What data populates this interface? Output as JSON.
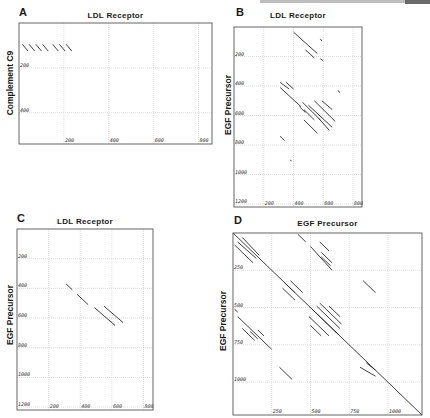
{
  "figure": {
    "panels": [
      {
        "id": "A",
        "letter": "A",
        "title": "LDL Receptor",
        "ylabel": "Complement C9"
      },
      {
        "id": "B",
        "letter": "B",
        "title": "LDL Receptor",
        "ylabel": "EGF Precursor"
      },
      {
        "id": "C",
        "letter": "C",
        "title": "LDL Receptor",
        "ylabel": "EGF Precursor"
      },
      {
        "id": "D",
        "letter": "D",
        "title": "EGF Precursor",
        "ylabel": "EGF Precursor"
      }
    ]
  },
  "chart_data": [
    {
      "type": "scatter",
      "subtype": "dot-matrix",
      "panel": "A",
      "title": "LDL Receptor",
      "xlabel": "LDL Receptor",
      "ylabel": "Complement C9",
      "xlim": [
        0,
        860
      ],
      "ylim": [
        540,
        0
      ],
      "x_ticks": [
        200,
        400,
        600,
        800
      ],
      "x_tick_labels": [
        "200",
        "400",
        "600",
        "800"
      ],
      "y_ticks": [
        200,
        400
      ],
      "y_tick_labels": [
        "200",
        "400"
      ],
      "grid": true,
      "segments": [
        [
          [
            15,
            95
          ],
          [
            40,
            125
          ]
        ],
        [
          [
            45,
            95
          ],
          [
            70,
            125
          ]
        ],
        [
          [
            75,
            95
          ],
          [
            100,
            125
          ]
        ],
        [
          [
            105,
            95
          ],
          [
            130,
            125
          ]
        ],
        [
          [
            150,
            95
          ],
          [
            175,
            125
          ]
        ],
        [
          [
            180,
            95
          ],
          [
            205,
            125
          ]
        ],
        [
          [
            210,
            95
          ],
          [
            235,
            125
          ]
        ]
      ]
    },
    {
      "type": "scatter",
      "subtype": "dot-matrix",
      "panel": "B",
      "title": "LDL Receptor",
      "xlabel": "LDL Receptor",
      "ylabel": "EGF Precursor",
      "xlim": [
        0,
        860
      ],
      "ylim": [
        1220,
        0
      ],
      "x_ticks": [
        200,
        400,
        600,
        800
      ],
      "x_tick_labels": [
        "200",
        "400",
        "600",
        "800"
      ],
      "y_ticks": [
        200,
        400,
        600,
        800,
        1000,
        1200
      ],
      "y_tick_labels": [
        "200",
        "400",
        "600",
        "800",
        "1000",
        "1200"
      ],
      "grid": true,
      "segments": [
        [
          [
            400,
            35
          ],
          [
            560,
            180
          ]
        ],
        [
          [
            480,
            155
          ],
          [
            540,
            210
          ]
        ],
        [
          [
            580,
            80
          ],
          [
            590,
            95
          ]
        ],
        [
          [
            580,
            215
          ],
          [
            600,
            230
          ]
        ],
        [
          [
            310,
            375
          ],
          [
            370,
            420
          ]
        ],
        [
          [
            350,
            375
          ],
          [
            400,
            420
          ]
        ],
        [
          [
            310,
            410
          ],
          [
            450,
            540
          ]
        ],
        [
          [
            460,
            510
          ],
          [
            580,
            630
          ]
        ],
        [
          [
            440,
            540
          ],
          [
            480,
            580
          ]
        ],
        [
          [
            470,
            560
          ],
          [
            540,
            630
          ]
        ],
        [
          [
            500,
            530
          ],
          [
            660,
            680
          ]
        ],
        [
          [
            540,
            500
          ],
          [
            680,
            640
          ]
        ],
        [
          [
            590,
            500
          ],
          [
            660,
            560
          ]
        ],
        [
          [
            470,
            630
          ],
          [
            560,
            720
          ]
        ],
        [
          [
            570,
            620
          ],
          [
            640,
            700
          ]
        ],
        [
          [
            700,
            430
          ],
          [
            710,
            445
          ]
        ],
        [
          [
            310,
            740
          ],
          [
            340,
            770
          ]
        ],
        [
          [
            380,
            900
          ],
          [
            385,
            910
          ]
        ]
      ]
    },
    {
      "type": "scatter",
      "subtype": "dot-matrix",
      "panel": "C",
      "title": "LDL Receptor",
      "xlabel": "LDL Receptor",
      "ylabel": "EGF Precursor",
      "xlim": [
        0,
        860
      ],
      "ylim": [
        1220,
        0
      ],
      "x_ticks": [
        200,
        400,
        600,
        800
      ],
      "x_tick_labels": [
        "200",
        "400",
        "600",
        "800"
      ],
      "y_ticks": [
        200,
        400,
        600,
        800,
        1000,
        1200
      ],
      "y_tick_labels": [
        "200",
        "400",
        "600",
        "800",
        "1000",
        "1200"
      ],
      "grid": true,
      "segments": [
        [
          [
            310,
            370
          ],
          [
            350,
            410
          ]
        ],
        [
          [
            380,
            440
          ],
          [
            450,
            510
          ]
        ],
        [
          [
            490,
            530
          ],
          [
            620,
            650
          ]
        ],
        [
          [
            550,
            520
          ],
          [
            670,
            630
          ]
        ]
      ]
    },
    {
      "type": "scatter",
      "subtype": "dot-matrix",
      "panel": "D",
      "title": "EGF Precursor",
      "xlabel": "EGF Precursor",
      "ylabel": "EGF Precursor",
      "xlim": [
        0,
        1220
      ],
      "ylim": [
        1220,
        0
      ],
      "x_ticks": [
        250,
        500,
        750,
        1000
      ],
      "x_tick_labels": [
        "250",
        "500",
        "750",
        "1000"
      ],
      "y_ticks": [
        250,
        500,
        750,
        1000
      ],
      "y_tick_labels": [
        "250",
        "500",
        "750",
        "1000"
      ],
      "grid": true,
      "segments": [
        [
          [
            0,
            0
          ],
          [
            1220,
            1220
          ]
        ],
        [
          [
            60,
            30
          ],
          [
            170,
            150
          ]
        ],
        [
          [
            30,
            60
          ],
          [
            150,
            170
          ]
        ],
        [
          [
            10,
            80
          ],
          [
            130,
            200
          ]
        ],
        [
          [
            330,
            330
          ],
          [
            400,
            400
          ]
        ],
        [
          [
            370,
            320
          ],
          [
            450,
            400
          ]
        ],
        [
          [
            320,
            370
          ],
          [
            400,
            450
          ]
        ],
        [
          [
            420,
            10
          ],
          [
            470,
            60
          ]
        ],
        [
          [
            500,
            90
          ],
          [
            640,
            250
          ]
        ],
        [
          [
            560,
            60
          ],
          [
            620,
            120
          ]
        ],
        [
          [
            570,
            130
          ],
          [
            640,
            200
          ]
        ],
        [
          [
            570,
            160
          ],
          [
            630,
            220
          ]
        ],
        [
          [
            840,
            320
          ],
          [
            920,
            400
          ]
        ],
        [
          [
            510,
            510
          ],
          [
            680,
            680
          ]
        ],
        [
          [
            490,
            560
          ],
          [
            620,
            690
          ]
        ],
        [
          [
            540,
            490
          ],
          [
            690,
            640
          ]
        ],
        [
          [
            560,
            470
          ],
          [
            700,
            610
          ]
        ],
        [
          [
            500,
            620
          ],
          [
            570,
            690
          ]
        ],
        [
          [
            620,
            490
          ],
          [
            690,
            560
          ]
        ],
        [
          [
            10,
            510
          ],
          [
            30,
            530
          ]
        ],
        [
          [
            30,
            560
          ],
          [
            250,
            780
          ]
        ],
        [
          [
            60,
            640
          ],
          [
            140,
            720
          ]
        ],
        [
          [
            110,
            660
          ],
          [
            160,
            710
          ]
        ],
        [
          [
            160,
            650
          ],
          [
            200,
            690
          ]
        ],
        [
          [
            300,
            900
          ],
          [
            380,
            980
          ]
        ],
        [
          [
            820,
            900
          ],
          [
            920,
            960
          ]
        ],
        [
          [
            860,
            870
          ],
          [
            920,
            920
          ]
        ]
      ]
    }
  ]
}
